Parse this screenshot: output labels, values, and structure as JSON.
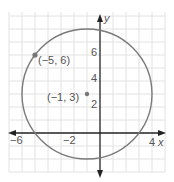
{
  "figure": {
    "type": "circle-on-coordinate-plane",
    "axes": {
      "x_label": "x",
      "y_label": "y",
      "x_ticks": [
        "−6",
        "−2",
        "4"
      ],
      "y_ticks": [
        "2",
        "4",
        "6"
      ]
    },
    "center": {
      "label": "(−1, 3)",
      "x": -1,
      "y": 3
    },
    "point": {
      "label": "(−5, 6)",
      "x": -5,
      "y": 6
    },
    "radius": 5,
    "colors": {
      "grid": "#dddddd",
      "axis": "#222222",
      "circle": "#777777",
      "point": "#777777"
    }
  }
}
